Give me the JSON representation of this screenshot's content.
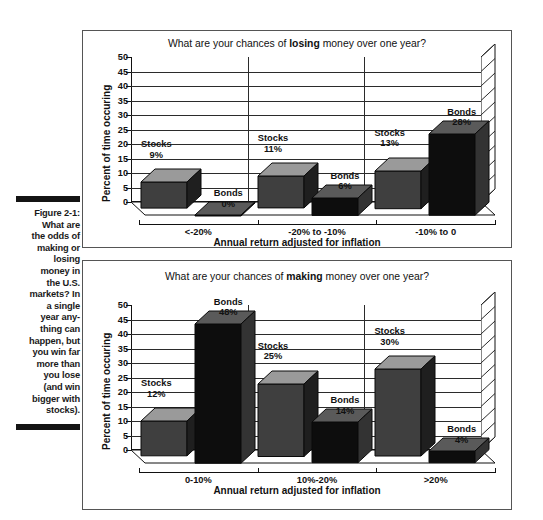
{
  "figure": {
    "label": "Figure 2-1:",
    "caption_lines": [
      "What are",
      "the odds of",
      "making or",
      "losing",
      "money in",
      "the U.S.",
      "markets? In",
      "a single",
      "year any-",
      "thing can",
      "happen, but",
      "you win far",
      "more than",
      "you lose",
      "(and win",
      "bigger with",
      "stocks)."
    ]
  },
  "colors": {
    "stocks_front": "#3f3f3f",
    "stocks_top": "#9a9a9a",
    "stocks_side": "#1f1f1f",
    "bonds_front": "#0d0d0d",
    "bonds_top": "#5a5a5a",
    "bonds_side": "#333333",
    "axis": "#111111",
    "grid": "#2b2b2b",
    "frame": "#555555",
    "rule": "#141414"
  },
  "chart_data": [
    {
      "id": "losing",
      "type": "bar",
      "title_prefix": "What are your chances of ",
      "title_emphasis": "losing",
      "title_suffix": " money over one year?",
      "title": "What are your chances of losing money over one year?",
      "xlabel": "Annual return adjusted for inflation",
      "ylabel": "Percent of time occuring",
      "ylim": [
        0,
        50
      ],
      "ytick_step": 5,
      "yticks": [
        "50",
        "45",
        "40",
        "35",
        "30",
        "25",
        "20",
        "15",
        "10",
        "5",
        "0"
      ],
      "grid": true,
      "legend": "none",
      "categories": [
        "<-20%",
        "-20% to -10%",
        "-10% to 0"
      ],
      "series": [
        {
          "name": "Stocks",
          "values": [
            9,
            11,
            13
          ],
          "labels": [
            "9%",
            "11%",
            "13%"
          ]
        },
        {
          "name": "Bonds",
          "values": [
            0,
            6,
            28
          ],
          "labels": [
            "0%",
            "6%",
            "28%"
          ]
        }
      ]
    },
    {
      "id": "making",
      "type": "bar",
      "title_prefix": "What are your chances of ",
      "title_emphasis": "making",
      "title_suffix": " money over one year?",
      "title": "What are your chances of making money over one year?",
      "xlabel": "Annual return adjusted for inflation",
      "ylabel": "Percent of time occuring",
      "ylim": [
        0,
        50
      ],
      "ytick_step": 5,
      "yticks": [
        "50",
        "45",
        "40",
        "35",
        "30",
        "25",
        "20",
        "15",
        "10",
        "5",
        "0"
      ],
      "grid": true,
      "legend": "none",
      "categories": [
        "0-10%",
        "10%-20%",
        ">20%"
      ],
      "series": [
        {
          "name": "Stocks",
          "values": [
            12,
            25,
            30
          ],
          "labels": [
            "12%",
            "25%",
            "30%"
          ]
        },
        {
          "name": "Bonds",
          "values": [
            48,
            14,
            4
          ],
          "labels": [
            "48%",
            "14%",
            "4%"
          ]
        }
      ]
    }
  ]
}
